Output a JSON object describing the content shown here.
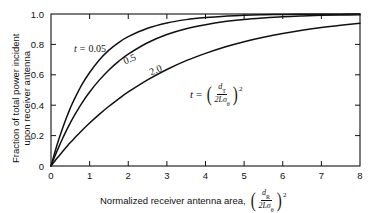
{
  "chart_data": {
    "type": "line",
    "title": "",
    "xlabel": "Normalized receiver antenna area, (d_R / 2Lσ_θ)^2",
    "ylabel": "Fraction of total power incident upon receiver antenna",
    "xlim": [
      0,
      8
    ],
    "ylim": [
      0,
      1.0
    ],
    "grid": false,
    "legend_position": "inline-curve-labels",
    "x_ticks": [
      "0",
      "1",
      "2",
      "3",
      "4",
      "5",
      "6",
      "7",
      "8"
    ],
    "x_tick_values": [
      0,
      1,
      2,
      3,
      4,
      5,
      6,
      7,
      8
    ],
    "y_ticks": [
      "0",
      "0.2",
      "0.4",
      "0.6",
      "0.8",
      "1.0"
    ],
    "y_tick_values": [
      0,
      0.2,
      0.4,
      0.6,
      0.8,
      1.0
    ],
    "annotation": "t = (d_T / 2Lσ_θ)^2",
    "x": [
      0,
      0.1,
      0.2,
      0.3,
      0.4,
      0.5,
      0.6,
      0.8,
      1.0,
      1.25,
      1.5,
      1.75,
      2.0,
      2.5,
      3.0,
      3.5,
      4.0,
      4.5,
      5.0,
      5.5,
      6.0,
      6.5,
      7.0,
      7.5,
      8.0
    ],
    "series": [
      {
        "name": "t = 0.05",
        "label": "0.05",
        "t": 0.05,
        "values": [
          0,
          0.091,
          0.174,
          0.249,
          0.318,
          0.381,
          0.437,
          0.535,
          0.615,
          0.698,
          0.762,
          0.812,
          0.851,
          0.906,
          0.941,
          0.963,
          0.977,
          0.986,
          0.991,
          0.995,
          0.997,
          0.998,
          0.999,
          0.999,
          1.0
        ]
      },
      {
        "name": "t = 0.5",
        "label": "0.5",
        "t": 0.5,
        "values": [
          0,
          0.064,
          0.124,
          0.181,
          0.234,
          0.284,
          0.33,
          0.414,
          0.487,
          0.565,
          0.632,
          0.688,
          0.736,
          0.811,
          0.865,
          0.903,
          0.93,
          0.95,
          0.964,
          0.974,
          0.982,
          0.987,
          0.991,
          0.993,
          0.995
        ]
      },
      {
        "name": "t = 2.0",
        "label": "2.0",
        "t": 2.0,
        "values": [
          0,
          0.033,
          0.064,
          0.095,
          0.125,
          0.154,
          0.181,
          0.234,
          0.283,
          0.34,
          0.393,
          0.441,
          0.487,
          0.567,
          0.635,
          0.693,
          0.741,
          0.783,
          0.818,
          0.847,
          0.872,
          0.893,
          0.911,
          0.926,
          0.939
        ]
      }
    ]
  },
  "axis": {
    "y_title_line1": "Fraction of total power incident",
    "y_title_line2": "upon receiver antenna",
    "x_title_text": "Normalized receiver antenna area,"
  },
  "curve_labels": {
    "first_prefix_var": "t",
    "first_prefix_eq": "=",
    "first_value": "0.05",
    "second_value": "0.5",
    "third_value": "2.0"
  },
  "annotation_math": {
    "lhs_var": "t",
    "eq": "=",
    "numerator_var": "d",
    "numerator_sub": "T",
    "denominator": "2Lσ",
    "denominator_sub": "θ",
    "exponent": "2"
  },
  "xlabel_math": {
    "numerator_var": "d",
    "numerator_sub": "R",
    "denominator": "2Lσ",
    "denominator_sub": "θ",
    "exponent": "2"
  },
  "style": {
    "line_color": "#111111",
    "background": "#ffffff",
    "axis_color": "#111111"
  }
}
